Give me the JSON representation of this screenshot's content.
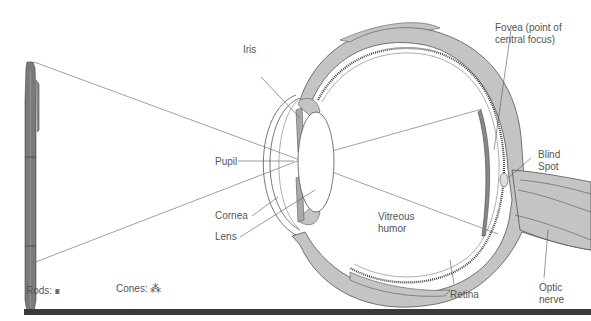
{
  "diagram": {
    "colors": {
      "tissue": "#c4c4c4",
      "outline": "#555555",
      "pen": "#7a7a7a",
      "bar": "#3a3a3a",
      "text": "#555555"
    },
    "labels": {
      "iris": "Iris",
      "pupil": "Pupil",
      "cornea": "Cornea",
      "lens": "Lens",
      "vitreous_line1": "Vitreous",
      "vitreous_line2": "humor",
      "fovea_line1": "Fovea (point of",
      "fovea_line2": "central focus)",
      "blind_line1": "Blind",
      "blind_line2": "Spot",
      "retina": "Retina",
      "optic_line1": "Optic",
      "optic_line2": "nerve"
    },
    "legend": {
      "rods_label": "Rods:",
      "rods_symbol": "IIII",
      "cones_label": "Cones:",
      "cones_symbol": "⁂"
    }
  }
}
